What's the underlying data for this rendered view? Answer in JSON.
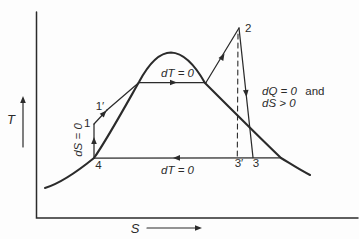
{
  "diagram": {
    "ink_color": "#2b2b2b",
    "background_color": "#fdfdfd",
    "y_axis": {
      "label": "T"
    },
    "x_axis": {
      "label": "S"
    },
    "points": {
      "p1": "1",
      "p1_prime": "1′",
      "p2": "2",
      "p3": "3",
      "p3_prime": "3′",
      "p4": "4"
    },
    "labels": {
      "top_isotherm": "dT = 0",
      "bottom_isotherm": "dT = 0",
      "isentrope": "dS = 0",
      "adiabat_math1": "dQ = 0",
      "adiabat_word": "and",
      "adiabat_math2": "dS > 0"
    }
  }
}
